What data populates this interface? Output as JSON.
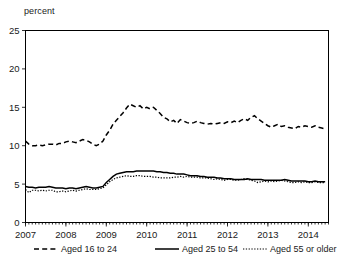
{
  "chart_data": {
    "type": "line",
    "title": "",
    "subtitle": "",
    "xlabel": "",
    "ylabel": "percent",
    "ylim": [
      0,
      25
    ],
    "yticks": [
      0,
      5,
      10,
      15,
      20,
      25
    ],
    "xlim": [
      2007.0,
      2014.5
    ],
    "xticks": [
      2007,
      2008,
      2009,
      2010,
      2011,
      2012,
      2013,
      2014
    ],
    "xtick_labels": [
      "2007",
      "2008",
      "2009",
      "2010",
      "2011",
      "2012",
      "2013",
      "2014"
    ],
    "grid": false,
    "legend_position": "bottom",
    "minor_ticks": "monthly on x-axis",
    "x": [
      2007.0,
      2007.083,
      2007.167,
      2007.25,
      2007.333,
      2007.417,
      2007.5,
      2007.583,
      2007.667,
      2007.75,
      2007.833,
      2007.917,
      2008.0,
      2008.083,
      2008.167,
      2008.25,
      2008.333,
      2008.417,
      2008.5,
      2008.583,
      2008.667,
      2008.75,
      2008.833,
      2008.917,
      2009.0,
      2009.083,
      2009.167,
      2009.25,
      2009.333,
      2009.417,
      2009.5,
      2009.583,
      2009.667,
      2009.75,
      2009.833,
      2009.917,
      2010.0,
      2010.083,
      2010.167,
      2010.25,
      2010.333,
      2010.417,
      2010.5,
      2010.583,
      2010.667,
      2010.75,
      2010.833,
      2010.917,
      2011.0,
      2011.083,
      2011.167,
      2011.25,
      2011.333,
      2011.417,
      2011.5,
      2011.583,
      2011.667,
      2011.75,
      2011.833,
      2011.917,
      2012.0,
      2012.083,
      2012.167,
      2012.25,
      2012.333,
      2012.417,
      2012.5,
      2012.583,
      2012.667,
      2012.75,
      2012.833,
      2012.917,
      2013.0,
      2013.083,
      2013.167,
      2013.25,
      2013.333,
      2013.417,
      2013.5,
      2013.583,
      2013.667,
      2013.75,
      2013.833,
      2013.917,
      2014.0,
      2014.083,
      2014.167,
      2014.25,
      2014.333,
      2014.417
    ],
    "series": [
      {
        "name": "Aged 16 to 24",
        "style": "dashed",
        "color": "#000000",
        "values": [
          10.6,
          10.2,
          10.0,
          10.0,
          10.1,
          10.0,
          10.1,
          10.2,
          10.2,
          10.1,
          10.3,
          10.3,
          10.5,
          10.6,
          10.5,
          10.4,
          10.6,
          10.8,
          10.7,
          10.5,
          10.2,
          10.0,
          10.2,
          10.6,
          11.4,
          12.0,
          12.8,
          13.3,
          13.8,
          14.3,
          14.9,
          15.4,
          15.2,
          15.0,
          15.2,
          14.8,
          15.0,
          14.8,
          15.0,
          14.6,
          14.2,
          13.7,
          13.5,
          13.1,
          13.3,
          12.9,
          13.4,
          13.2,
          13.0,
          12.9,
          13.0,
          13.2,
          13.0,
          12.9,
          12.8,
          12.9,
          12.8,
          12.9,
          13.0,
          12.9,
          13.1,
          13.0,
          13.2,
          13.0,
          13.3,
          13.5,
          13.3,
          13.7,
          13.9,
          13.5,
          13.2,
          12.9,
          12.6,
          12.4,
          12.6,
          12.8,
          12.5,
          12.6,
          12.4,
          12.3,
          12.2,
          12.5,
          12.4,
          12.6,
          12.5,
          12.4,
          12.6,
          12.4,
          12.3,
          12.2
        ]
      },
      {
        "name": "Aged 25 to 54",
        "style": "solid",
        "color": "#000000",
        "values": [
          4.7,
          4.6,
          4.6,
          4.5,
          4.6,
          4.6,
          4.6,
          4.7,
          4.6,
          4.5,
          4.5,
          4.5,
          4.4,
          4.5,
          4.5,
          4.4,
          4.5,
          4.6,
          4.7,
          4.6,
          4.5,
          4.5,
          4.6,
          4.7,
          5.2,
          5.6,
          6.0,
          6.3,
          6.4,
          6.5,
          6.6,
          6.6,
          6.6,
          6.7,
          6.7,
          6.7,
          6.7,
          6.7,
          6.7,
          6.6,
          6.6,
          6.5,
          6.5,
          6.4,
          6.4,
          6.3,
          6.3,
          6.3,
          6.2,
          6.1,
          6.1,
          6.1,
          6.0,
          6.0,
          5.9,
          5.9,
          5.9,
          5.8,
          5.8,
          5.7,
          5.7,
          5.7,
          5.6,
          5.6,
          5.6,
          5.6,
          5.7,
          5.6,
          5.6,
          5.6,
          5.6,
          5.5,
          5.5,
          5.5,
          5.5,
          5.5,
          5.5,
          5.6,
          5.5,
          5.4,
          5.4,
          5.4,
          5.4,
          5.4,
          5.3,
          5.3,
          5.4,
          5.3,
          5.3,
          5.3
        ]
      },
      {
        "name": "Aged 55 or older",
        "style": "dotted",
        "color": "#000000",
        "values": [
          4.3,
          3.9,
          4.2,
          4.2,
          4.1,
          4.2,
          4.1,
          4.2,
          4.2,
          4.0,
          4.0,
          4.1,
          4.0,
          4.1,
          4.2,
          4.1,
          4.2,
          4.3,
          4.4,
          4.3,
          4.3,
          4.3,
          4.4,
          4.5,
          4.9,
          5.3,
          5.6,
          5.8,
          5.9,
          6.0,
          6.1,
          6.0,
          6.0,
          6.1,
          6.1,
          6.0,
          6.0,
          6.0,
          5.9,
          5.9,
          5.8,
          5.8,
          5.8,
          5.8,
          5.9,
          5.9,
          6.0,
          5.9,
          6.0,
          5.9,
          5.9,
          5.9,
          5.8,
          5.8,
          5.8,
          5.7,
          5.6,
          5.7,
          5.6,
          5.5,
          5.6,
          5.6,
          5.5,
          5.5,
          5.6,
          5.7,
          5.6,
          5.5,
          5.4,
          5.2,
          5.3,
          5.4,
          5.3,
          5.4,
          5.3,
          5.4,
          5.5,
          5.4,
          5.3,
          5.2,
          5.2,
          5.3,
          5.2,
          5.3,
          5.2,
          5.2,
          5.3,
          5.2,
          5.2,
          5.2
        ]
      }
    ],
    "legend": [
      {
        "label": "Aged 16 to 24",
        "style": "dashed"
      },
      {
        "label": "Aged 25 to 54",
        "style": "solid"
      },
      {
        "label": "Aged 55 or older",
        "style": "dotted"
      }
    ]
  }
}
